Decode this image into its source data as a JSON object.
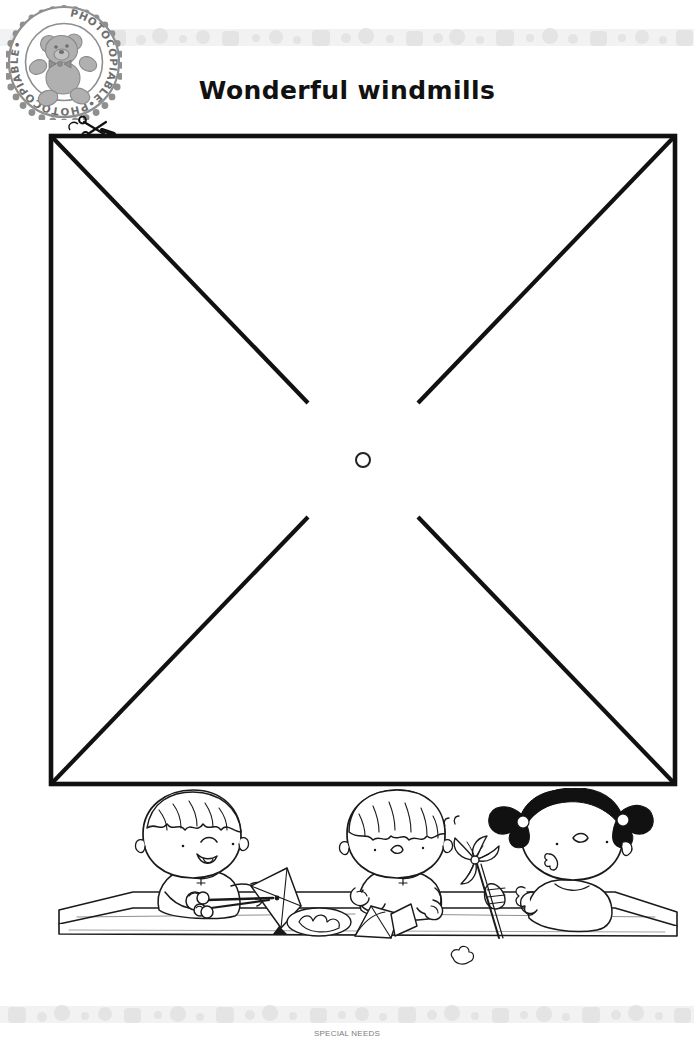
{
  "page": {
    "title": "Wonderful windmills",
    "background_color": "#ffffff",
    "ink_color": "#111111",
    "band_color": "#ebebeb",
    "band_dot_color": "#e0e0e0"
  },
  "stamp": {
    "text": "PHOTOCOPIABLE",
    "full_text": "PHOTOCOPIABLE•PHOTOCOPIABLE•",
    "icon": "teddy-bear-icon",
    "ring_color": "#8c8c8c",
    "bear_color": "#a6a6a6"
  },
  "template": {
    "shape": "square",
    "instruction_icon": "scissors-icon",
    "center_marker": "pin-hole-circle",
    "diagonals": 4,
    "square": {
      "left": 7,
      "top": 32,
      "width": 624,
      "height": 648
    },
    "center": {
      "x": 319,
      "y": 356
    },
    "pin_hole_radius": 7,
    "diagonal_gap": 78,
    "stroke_width": 4,
    "scissors": {
      "x": 54,
      "y": 20
    }
  },
  "illustration": {
    "name": "children-making-pinwheels",
    "children": [
      {
        "name": "child-cutting",
        "hair": "light",
        "activity": "cutting paper square with scissors"
      },
      {
        "name": "child-folding",
        "hair": "light",
        "activity": "folding paper points to the centre"
      },
      {
        "name": "child-blowing-pinwheel",
        "hair": "dark-pigtails",
        "activity": "blowing a finished pinwheel on a stick"
      }
    ],
    "props": [
      "table",
      "paper-square",
      "scissors",
      "drawing-pin",
      "paper-scraps",
      "pinwheel"
    ]
  },
  "footer": {
    "text": "SPECIAL NEEDS"
  }
}
